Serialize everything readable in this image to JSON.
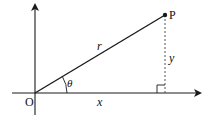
{
  "diagram": {
    "type": "polar-coordinates",
    "labels": {
      "origin": "O",
      "point": "P",
      "radius": "r",
      "angle": "θ",
      "x_component": "x",
      "y_component": "y"
    },
    "colors": {
      "stroke": "#1a1a1a",
      "dashed": "#555555",
      "background": "#ffffff"
    }
  }
}
